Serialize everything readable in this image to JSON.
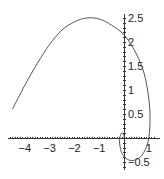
{
  "chart_data": {
    "type": "line",
    "title": "",
    "xlabel": "",
    "ylabel": "",
    "xlim": [
      -4.6,
      1.3
    ],
    "ylim": [
      -0.6,
      2.6
    ],
    "grid": false,
    "legend": null,
    "x_ticks": [
      "-4",
      "-3",
      "-2",
      "-1",
      "1"
    ],
    "y_ticks": [
      "0.5",
      "1",
      "1.5",
      "2",
      "2.5",
      "-0.5"
    ],
    "series": [
      {
        "name": "parametric curve",
        "points": [
          [
            -4.5,
            0.6
          ],
          [
            -4.0,
            1.1
          ],
          [
            -3.5,
            1.55
          ],
          [
            -3.0,
            1.95
          ],
          [
            -2.5,
            2.25
          ],
          [
            -2.0,
            2.42
          ],
          [
            -1.5,
            2.5
          ],
          [
            -1.0,
            2.48
          ],
          [
            -0.5,
            2.35
          ],
          [
            0.0,
            2.15
          ],
          [
            0.4,
            1.85
          ],
          [
            0.75,
            1.45
          ],
          [
            0.95,
            1.0
          ],
          [
            1.05,
            0.5
          ],
          [
            1.0,
            0.0
          ],
          [
            0.8,
            -0.3
          ],
          [
            0.5,
            -0.45
          ],
          [
            0.15,
            -0.45
          ],
          [
            -0.1,
            -0.3
          ],
          [
            -0.18,
            -0.05
          ],
          [
            -0.1,
            0.1
          ],
          [
            0.0,
            0.05
          ],
          [
            0.0,
            0.0
          ]
        ]
      }
    ]
  },
  "axes": {
    "x_labels": [
      {
        "value": -4,
        "text": "−4"
      },
      {
        "value": -3,
        "text": "−3"
      },
      {
        "value": -2,
        "text": "−2"
      },
      {
        "value": -1,
        "text": "−1"
      },
      {
        "value": 1,
        "text": "1"
      }
    ],
    "y_labels": [
      {
        "value": 2.5,
        "text": "2.5"
      },
      {
        "value": 2,
        "text": "2"
      },
      {
        "value": 1.5,
        "text": "1.5"
      },
      {
        "value": 1,
        "text": "1"
      },
      {
        "value": 0.5,
        "text": "0.5"
      },
      {
        "value": -0.5,
        "text": "−0.5"
      }
    ]
  },
  "colors": {
    "curve": "#555555",
    "axis": "#333333"
  }
}
